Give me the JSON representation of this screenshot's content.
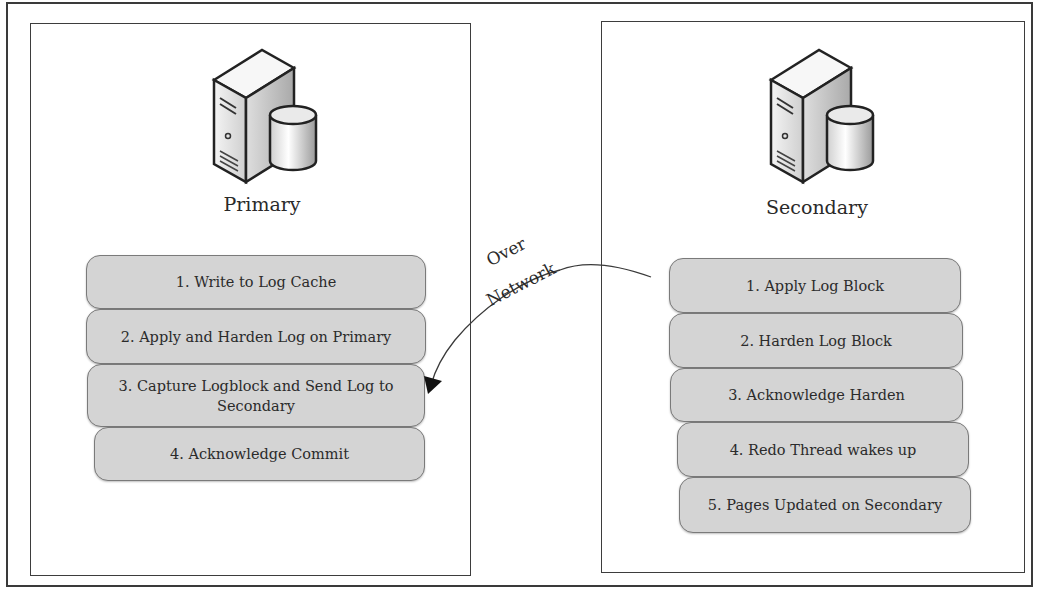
{
  "diagram": {
    "primary": {
      "title": "Primary",
      "icon": "database-server-icon",
      "steps": [
        "1. Write to Log Cache",
        "2. Apply and Harden Log on Primary",
        "3. Capture Logblock and Send Log to Secondary",
        "4. Acknowledge Commit"
      ]
    },
    "secondary": {
      "title": "Secondary",
      "icon": "database-server-icon",
      "steps": [
        "1. Apply Log Block",
        "2. Harden Log Block",
        "3. Acknowledge Harden",
        "4. Redo Thread wakes up",
        "5. Pages Updated on Secondary"
      ]
    },
    "connector": {
      "label_line1": "Over",
      "label_line2": "Network",
      "from": "secondary.steps.0",
      "to": "primary.steps.2"
    },
    "colors": {
      "step_fill": "#d4d4d4",
      "step_border": "#7a7a7a",
      "panel_border": "#3d3d3d"
    }
  }
}
